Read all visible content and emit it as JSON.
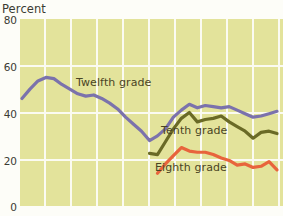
{
  "axis": {
    "y_title": "Percent",
    "y_ticks": [
      80,
      60,
      40,
      20,
      0
    ],
    "ylim": [
      0,
      80
    ]
  },
  "labels": {
    "twelfth": "Twelfth grade",
    "tenth": "Tenth grade",
    "eighth": "Eighth grade"
  },
  "colors": {
    "plot_background": "#e3e39b",
    "gridline": "#fbfbf2",
    "twelfth": "#7b72ac",
    "tenth": "#6a6a26",
    "eighth": "#e8643c",
    "text": "#3b3b33",
    "label_text": "#4a4424"
  },
  "chart_data": {
    "type": "line",
    "title": "",
    "subtitle": "",
    "xlabel": "",
    "ylabel": "Percent",
    "ylim": [
      0,
      80
    ],
    "yticks": [
      0,
      20,
      40,
      60,
      80
    ],
    "grid": true,
    "legend": "inline-annotations",
    "x_axis_ticks_labeled": false,
    "x_gridline_count": 10,
    "series": [
      {
        "name": "Twelfth grade",
        "color": "#7b72ac",
        "x": [
          1,
          2,
          3,
          4,
          5,
          6,
          7,
          8,
          9,
          10,
          11,
          12,
          13,
          14,
          15,
          16,
          17,
          18,
          19,
          20,
          21,
          22,
          23,
          24,
          25,
          26,
          27,
          28,
          29,
          30,
          31,
          32,
          33
        ],
        "values": [
          46.0,
          50.0,
          53.5,
          55.0,
          54.5,
          52.0,
          50.0,
          48.0,
          47.0,
          47.5,
          46.0,
          44.0,
          41.5,
          38.0,
          35.0,
          32.0,
          28.0,
          30.0,
          33.0,
          38.0,
          41.0,
          43.5,
          42.0,
          43.0,
          42.5,
          42.0,
          42.5,
          41.0,
          39.5,
          38.0,
          38.5,
          39.5,
          40.5
        ]
      },
      {
        "name": "Tenth grade",
        "color": "#6a6a26",
        "x": [
          17,
          18,
          19,
          20,
          21,
          22,
          23,
          24,
          25,
          26,
          27,
          28,
          29,
          30,
          31,
          32,
          33
        ],
        "values": [
          22.5,
          22.0,
          27.5,
          33.0,
          37.5,
          40.0,
          36.0,
          37.0,
          37.5,
          38.5,
          36.0,
          34.0,
          32.0,
          29.0,
          31.5,
          32.0,
          31.0
        ]
      },
      {
        "name": "Eighth grade",
        "color": "#e8643c",
        "x": [
          18,
          19,
          20,
          21,
          22,
          23,
          24,
          25,
          26,
          27,
          28,
          29,
          30,
          31,
          32,
          33
        ],
        "values": [
          14.0,
          18.0,
          21.5,
          25.0,
          23.5,
          23.0,
          23.0,
          22.0,
          20.5,
          19.5,
          17.5,
          18.0,
          16.5,
          17.0,
          19.0,
          15.5
        ]
      }
    ]
  }
}
